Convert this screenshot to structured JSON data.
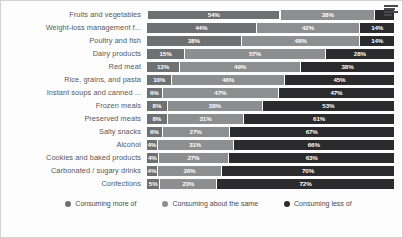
{
  "chart_data": {
    "type": "bar",
    "subtype": "stacked-horizontal-100",
    "title": "",
    "xlabel": "",
    "ylabel": "",
    "xlim": [
      0,
      100
    ],
    "grid": false,
    "legend_position": "bottom-center",
    "categories": [
      "Fruits and vegetables",
      "Weight-loss management f...",
      "Poultry and fish",
      "Dairy products",
      "Red meat",
      "Rice, grains, and pasta",
      "Instant soups and canned ...",
      "Frozen meals",
      "Preserved meats",
      "Salty snacks",
      "Alcohol",
      "Cookies and baked products",
      "Carbonated / sugary drinks",
      "Confections"
    ],
    "series": [
      {
        "name": "Consuming more of",
        "color": "#6f7072",
        "values": [
          54,
          44,
          38,
          15,
          13,
          10,
          6,
          8,
          8,
          6,
          4,
          4,
          4,
          5
        ],
        "labels": [
          "54%",
          "44%",
          "38%",
          "15%",
          "13%",
          "10%",
          "6%",
          "8%",
          "8%",
          "6%",
          "4%",
          "4%",
          "4%",
          "5%"
        ],
        "labels_visible": [
          true,
          true,
          true,
          true,
          true,
          true,
          true,
          true,
          true,
          true,
          true,
          true,
          true,
          true
        ]
      },
      {
        "name": "Consuming about the same",
        "color": "#8d8e90",
        "values": [
          38,
          42,
          48,
          57,
          49,
          46,
          47,
          38,
          31,
          27,
          31,
          27,
          26,
          23
        ],
        "labels": [
          "38%",
          "42%",
          "48%",
          "57%",
          "49%",
          "46%",
          "47%",
          "38%",
          "31%",
          "27%",
          "31%",
          "27%",
          "26%",
          "23%"
        ],
        "labels_visible": [
          true,
          true,
          true,
          true,
          true,
          true,
          true,
          true,
          true,
          true,
          true,
          true,
          true,
          true
        ]
      },
      {
        "name": "Consuming less of",
        "color": "#2b2b2d",
        "values": [
          8,
          14,
          14,
          28,
          38,
          45,
          47,
          53,
          61,
          67,
          66,
          63,
          70,
          72
        ],
        "labels": [
          "8%",
          "14%",
          "14%",
          "28%",
          "38%",
          "45%",
          "47%",
          "53%",
          "61%",
          "67%",
          "66%",
          "63%",
          "70%",
          "72%"
        ],
        "labels_visible": [
          false,
          true,
          true,
          true,
          true,
          true,
          true,
          true,
          true,
          true,
          true,
          true,
          true,
          true
        ]
      }
    ],
    "highlighted": {
      "row": 0,
      "series": 0
    }
  },
  "legend": {
    "items": [
      {
        "label": "Consuming more of",
        "color": "#6f7072"
      },
      {
        "label": "Consuming about the same",
        "color": "#8d8e90"
      },
      {
        "label": "Consuming less of",
        "color": "#2b2b2d"
      }
    ]
  },
  "icons": {
    "menu": "hamburger-menu-icon"
  }
}
